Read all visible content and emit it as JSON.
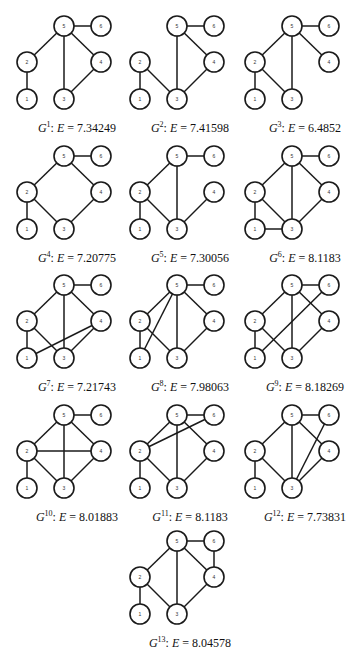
{
  "figure": {
    "node_radius": 10,
    "node_layout": {
      "5": [
        46,
        21
      ],
      "6": [
        83,
        21
      ],
      "2": [
        9,
        57
      ],
      "4": [
        83,
        57
      ],
      "1": [
        9,
        94
      ],
      "3": [
        46,
        94
      ]
    },
    "graphs": [
      {
        "id": "G1",
        "sup": "1",
        "energy_label": "E",
        "energy": "7.34249",
        "col": 0,
        "row": 0,
        "edges": [
          [
            5,
            6
          ],
          [
            5,
            2
          ],
          [
            5,
            3
          ],
          [
            5,
            4
          ],
          [
            2,
            1
          ],
          [
            4,
            3
          ]
        ]
      },
      {
        "id": "G2",
        "sup": "2",
        "energy_label": "E",
        "energy": "7.41598",
        "col": 1,
        "row": 0,
        "edges": [
          [
            5,
            6
          ],
          [
            5,
            3
          ],
          [
            5,
            4
          ],
          [
            2,
            1
          ],
          [
            2,
            3
          ],
          [
            4,
            3
          ]
        ]
      },
      {
        "id": "G3",
        "sup": "3",
        "energy_label": "E",
        "energy": "6.4852",
        "col": 2,
        "row": 0,
        "edges": [
          [
            5,
            6
          ],
          [
            5,
            2
          ],
          [
            5,
            3
          ],
          [
            5,
            4
          ],
          [
            2,
            1
          ],
          [
            2,
            3
          ]
        ]
      },
      {
        "id": "G4",
        "sup": "4",
        "energy_label": "E",
        "energy": "7.20775",
        "col": 0,
        "row": 1,
        "edges": [
          [
            5,
            6
          ],
          [
            5,
            2
          ],
          [
            5,
            4
          ],
          [
            2,
            1
          ],
          [
            2,
            3
          ],
          [
            4,
            3
          ]
        ]
      },
      {
        "id": "G5",
        "sup": "5",
        "energy_label": "E",
        "energy": "7.30056",
        "col": 1,
        "row": 1,
        "edges": [
          [
            5,
            6
          ],
          [
            5,
            2
          ],
          [
            5,
            3
          ],
          [
            2,
            1
          ],
          [
            2,
            3
          ],
          [
            4,
            3
          ]
        ]
      },
      {
        "id": "G6",
        "sup": "6",
        "energy_label": "E",
        "energy": "8.1183",
        "col": 2,
        "row": 1,
        "edges": [
          [
            5,
            6
          ],
          [
            5,
            2
          ],
          [
            5,
            3
          ],
          [
            5,
            4
          ],
          [
            2,
            1
          ],
          [
            2,
            3
          ],
          [
            1,
            3
          ],
          [
            4,
            3
          ]
        ]
      },
      {
        "id": "G7",
        "sup": "7",
        "energy_label": "E",
        "energy": "7.21743",
        "col": 0,
        "row": 2,
        "edges": [
          [
            5,
            6
          ],
          [
            5,
            2
          ],
          [
            5,
            3
          ],
          [
            5,
            4
          ],
          [
            2,
            1
          ],
          [
            2,
            3
          ],
          [
            1,
            4
          ],
          [
            4,
            3
          ]
        ]
      },
      {
        "id": "G8",
        "sup": "8",
        "energy_label": "E",
        "energy": "7.98063",
        "col": 1,
        "row": 2,
        "edges": [
          [
            5,
            6
          ],
          [
            5,
            2
          ],
          [
            5,
            1
          ],
          [
            5,
            3
          ],
          [
            5,
            4
          ],
          [
            2,
            1
          ],
          [
            2,
            3
          ],
          [
            4,
            3
          ]
        ]
      },
      {
        "id": "G9",
        "sup": "9",
        "energy_label": "E",
        "energy": "8.18269",
        "col": 2,
        "row": 2,
        "edges": [
          [
            5,
            6
          ],
          [
            5,
            2
          ],
          [
            5,
            3
          ],
          [
            5,
            4
          ],
          [
            2,
            1
          ],
          [
            2,
            3
          ],
          [
            1,
            6
          ],
          [
            4,
            3
          ]
        ]
      },
      {
        "id": "G10",
        "sup": "10",
        "energy_label": "E",
        "energy": "8.01883",
        "col": 0,
        "row": 3,
        "edges": [
          [
            5,
            6
          ],
          [
            5,
            2
          ],
          [
            5,
            3
          ],
          [
            5,
            4
          ],
          [
            2,
            1
          ],
          [
            2,
            4
          ],
          [
            2,
            3
          ],
          [
            4,
            3
          ]
        ]
      },
      {
        "id": "G11",
        "sup": "11",
        "energy_label": "E",
        "energy": "8.1183",
        "col": 1,
        "row": 3,
        "edges": [
          [
            5,
            6
          ],
          [
            5,
            2
          ],
          [
            5,
            3
          ],
          [
            5,
            4
          ],
          [
            2,
            6
          ],
          [
            2,
            1
          ],
          [
            2,
            3
          ],
          [
            4,
            3
          ]
        ]
      },
      {
        "id": "G12",
        "sup": "12",
        "energy_label": "E",
        "energy": "7.73831",
        "col": 2,
        "row": 3,
        "edges": [
          [
            5,
            6
          ],
          [
            5,
            2
          ],
          [
            5,
            3
          ],
          [
            5,
            4
          ],
          [
            2,
            1
          ],
          [
            2,
            3
          ],
          [
            6,
            3
          ],
          [
            4,
            3
          ]
        ]
      },
      {
        "id": "G13",
        "sup": "13",
        "energy_label": "E",
        "energy": "8.04578",
        "col": 1,
        "row": 4,
        "edges": [
          [
            5,
            6
          ],
          [
            5,
            2
          ],
          [
            5,
            3
          ],
          [
            5,
            4
          ],
          [
            6,
            4
          ],
          [
            2,
            1
          ],
          [
            2,
            3
          ],
          [
            4,
            3
          ]
        ]
      }
    ]
  }
}
